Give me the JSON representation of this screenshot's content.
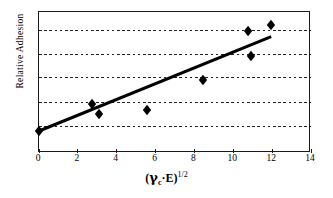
{
  "chart_data": {
    "type": "scatter",
    "title": "",
    "xlabel": "(γc·E)^1/2",
    "xlabel_parts": {
      "open_paren": "(",
      "gamma": "γ",
      "gamma_subscript": "c",
      "dot": "·",
      "e_symbol": "E",
      "close_paren": ")",
      "exponent": "1/2"
    },
    "ylabel": "Relative Adhesion",
    "xlim": [
      0,
      14
    ],
    "xticks": [
      0,
      2,
      4,
      6,
      8,
      10,
      12,
      14
    ],
    "xtick_labels": [
      "0",
      "2",
      "4",
      "6",
      "8",
      "10",
      "12",
      "14"
    ],
    "ylim": [
      0,
      1
    ],
    "yticks": [],
    "ytick_labels": [],
    "grid": {
      "horizontal": true,
      "vertical": false,
      "style": "dotted",
      "y_positions_normalized": [
        0.185,
        0.355,
        0.532,
        0.702,
        0.872
      ],
      "count": 5
    },
    "series": [
      {
        "name": "Relative Adhesion data",
        "marker": "diamond",
        "marker_color": "#000000",
        "points": [
          {
            "x": 0.0,
            "y": 0.156
          },
          {
            "x": 2.73,
            "y": 0.348
          },
          {
            "x": 3.09,
            "y": 0.277
          },
          {
            "x": 5.56,
            "y": 0.305
          },
          {
            "x": 8.44,
            "y": 0.518
          },
          {
            "x": 10.76,
            "y": 0.865
          },
          {
            "x": 10.91,
            "y": 0.688
          },
          {
            "x": 11.94,
            "y": 0.908
          }
        ]
      },
      {
        "name": "Linear trend line",
        "type": "line",
        "line_color": "#000000",
        "line_width": 3,
        "endpoints": [
          {
            "x": 0.0,
            "y": 0.156
          },
          {
            "x": 11.95,
            "y": 0.826
          }
        ]
      }
    ],
    "axis_color": "#1a1a1a",
    "background": "#ffffff"
  },
  "axes": {
    "x_title": "(γc·E)1/2",
    "y_title": "Relative Adhesion"
  },
  "ticks": {
    "x": [
      "0",
      "2",
      "4",
      "6",
      "8",
      "10",
      "12",
      "14"
    ]
  }
}
